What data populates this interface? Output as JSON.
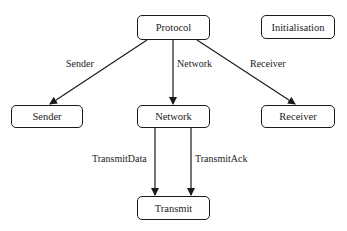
{
  "diagram": {
    "nodes": [
      {
        "id": "protocol",
        "label": "Protocol"
      },
      {
        "id": "initialisation",
        "label": "Initialisation"
      },
      {
        "id": "sender",
        "label": "Sender"
      },
      {
        "id": "network",
        "label": "Network"
      },
      {
        "id": "receiver",
        "label": "Receiver"
      },
      {
        "id": "transmit",
        "label": "Transmit"
      }
    ],
    "edges": [
      {
        "from": "protocol",
        "to": "sender",
        "label": "Sender"
      },
      {
        "from": "protocol",
        "to": "network",
        "label": "Network"
      },
      {
        "from": "protocol",
        "to": "receiver",
        "label": "Receiver"
      },
      {
        "from": "network",
        "to": "transmit",
        "label": "TransmitData"
      },
      {
        "from": "network",
        "to": "transmit",
        "label": "TransmitAck"
      }
    ]
  }
}
